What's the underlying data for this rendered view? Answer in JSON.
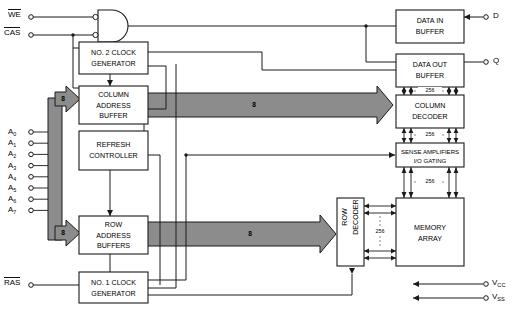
{
  "diagram": {
    "bus_width_label": "8",
    "array_bus_label": "256"
  },
  "inputs": {
    "we": "WE",
    "cas": "CAS",
    "ras": "RAS",
    "address_pins": [
      "A 0",
      "A 1",
      "A 2",
      "A 3",
      "A 4",
      "A 5",
      "A 6",
      "A 7"
    ],
    "address_base": "A",
    "address_indices": [
      "0",
      "1",
      "2",
      "3",
      "4",
      "5",
      "6",
      "7"
    ]
  },
  "outputs": {
    "data_in": "D",
    "data_out": "Q",
    "vcc": "V",
    "vcc_sub": "CC",
    "vss": "V",
    "vss_sub": "SS"
  },
  "blocks": {
    "clock2": {
      "line1": "NO. 2 CLOCK",
      "line2": "GENERATOR"
    },
    "clock1": {
      "line1": "NO. 1 CLOCK",
      "line2": "GENERATOR"
    },
    "column_address_buffer": {
      "line1": "COLUMN",
      "line2": "ADDRESS",
      "line3": "BUFFER"
    },
    "refresh_controller": {
      "line1": "REFRESH",
      "line2": "CONTROLLER"
    },
    "row_address_buffers": {
      "line1": "ROW",
      "line2": "ADDRESS",
      "line3": "BUFFERS"
    },
    "data_in_buffer": {
      "line1": "DATA IN",
      "line2": "BUFFER"
    },
    "data_out_buffer": {
      "line1": "DATA OUT",
      "line2": "BUFFER"
    },
    "column_decoder": {
      "line1": "COLUMN",
      "line2": "DECODER"
    },
    "sense_amplifiers": {
      "line1": "SENSE AMPLIFIERS",
      "line2": "I/O GATING"
    },
    "row_decoder": {
      "line1": "ROW",
      "line2": "DECODER"
    },
    "memory_array": {
      "line1": "MEMORY",
      "line2": "ARRAY"
    }
  },
  "bus_labels": {
    "column_bus": "8",
    "row_bus": "8",
    "vertical_bus_top": "8",
    "vertical_bus_bottom": "8",
    "out_to_coldec": "256",
    "coldec_to_sense": "256",
    "sense_to_array": "256",
    "rowdec_to_array": "256"
  },
  "colors": {
    "bus_fill": "#8c8c8c",
    "line": "#1a1a1a",
    "background": "#ffffff"
  }
}
